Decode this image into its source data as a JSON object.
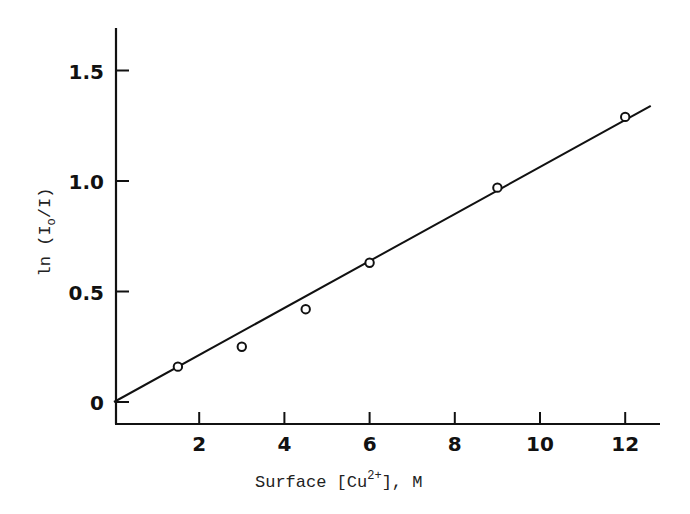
{
  "chart_data": {
    "type": "scatter",
    "title": "",
    "xlabel": "Surface [Cu2+], M",
    "xlabel_parts": {
      "main": "Surface [Cu",
      "sup": "2+",
      "tail": "], M"
    },
    "ylabel": "ln (I0/I)",
    "ylabel_parts": {
      "main": "ln (I",
      "sub": "o",
      "tail": "/I)"
    },
    "xlim": [
      0,
      12.6
    ],
    "ylim": [
      -0.05,
      1.7
    ],
    "x_ticks": [
      2,
      4,
      6,
      8,
      10,
      12
    ],
    "x_tick_labels": [
      "2",
      "4",
      "6",
      "8",
      "10",
      "12"
    ],
    "y_ticks": [
      0,
      0.5,
      1.0,
      1.5
    ],
    "y_tick_labels": [
      "0",
      "0.5",
      "1.0",
      "1.5"
    ],
    "grid": false,
    "legend": null,
    "series": [
      {
        "name": "measured",
        "marker": "open-circle",
        "x": [
          1.5,
          3.0,
          4.5,
          6.0,
          9.0,
          12.0
        ],
        "y": [
          0.16,
          0.25,
          0.42,
          0.63,
          0.97,
          1.29
        ]
      },
      {
        "name": "linear fit",
        "style": "line",
        "x": [
          0,
          12.6
        ],
        "y": [
          0,
          1.34
        ]
      }
    ]
  }
}
